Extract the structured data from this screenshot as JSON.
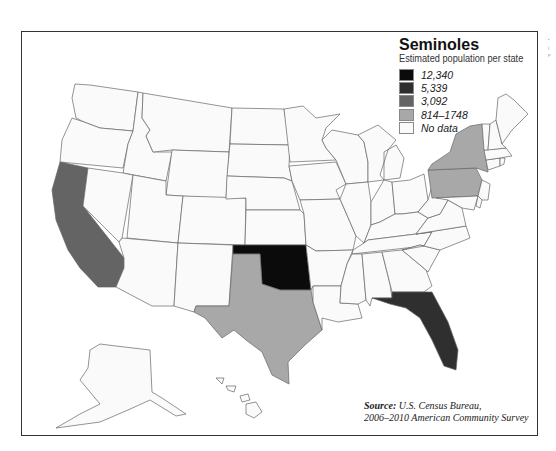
{
  "map": {
    "title": "Seminoles",
    "subtitle": "Estimated population per state",
    "region": "United States",
    "legend": [
      {
        "label": "12,340",
        "color": "#0b0b0b",
        "category": "12340"
      },
      {
        "label": "5,339",
        "color": "#2f2f2f",
        "category": "5339"
      },
      {
        "label": "3,092",
        "color": "#646464",
        "category": "3092"
      },
      {
        "label": "814–1748",
        "color": "#a8a8a8",
        "category": "814-1748"
      },
      {
        "label": "No data",
        "color": "#fafafa",
        "category": "none"
      }
    ],
    "highlighted_states": [
      {
        "state": "Oklahoma",
        "category": "12340"
      },
      {
        "state": "Florida",
        "category": "5339"
      },
      {
        "state": "California",
        "category": "3092"
      },
      {
        "state": "Texas",
        "category": "814-1748"
      },
      {
        "state": "New York",
        "category": "814-1748"
      },
      {
        "state": "Pennsylvania",
        "category": "814-1748"
      }
    ],
    "source_label": "Source:",
    "source_text_1": " U.S. Census Bureau,",
    "source_text_2": "2006–2010 American Community Survey"
  },
  "margin_marks": [
    "•",
    "(",
    "P"
  ]
}
